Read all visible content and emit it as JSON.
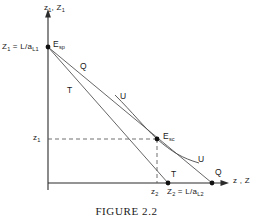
{
  "figure": {
    "caption": "FIGURE 2.2",
    "axes": {
      "y_axis_label_html": "z<sub>1</sub>, Z<sub>1</sub>",
      "y_axis_label_text": "z1, Z1",
      "x_axis_label_html": "z , Z",
      "x_axis_label_text": "z , Z",
      "y_intercept_label_html": "Z<sub>1</sub> = L/a<sub>L1</sub>",
      "y_intercept_label_text": "Z1 = L/aL1",
      "y_tick_label_html": "z<sub>1</sub>",
      "y_tick_label_text": "z1",
      "x_tick_label_html": "z<sub>2</sub>",
      "x_tick_label_text": "z2",
      "x_intercept_label_html": "Z<sub>2</sub> = L/a<sub>L2</sub>",
      "x_intercept_label_text": "Z2 = L/aL2"
    },
    "points": [
      {
        "id": "E-sp",
        "label_html": "E<sub>sp</sub>",
        "label_text": "Esp",
        "x": 48,
        "y": 47
      },
      {
        "id": "E-sc",
        "label_html": "E<sub>sc</sub>",
        "label_text": "Esc",
        "x": 157,
        "y": 139
      },
      {
        "id": "T-endpoint",
        "label_html": "T",
        "label_text": "T",
        "x": 168,
        "y": 183
      },
      {
        "id": "Q-endpoint",
        "label_html": "Q",
        "label_text": "Q",
        "x": 212,
        "y": 183
      }
    ],
    "curve_labels": [
      {
        "id": "Q-upper",
        "text": "Q",
        "x": 80,
        "y": 66
      },
      {
        "id": "T-upper",
        "text": "T",
        "x": 67,
        "y": 90
      },
      {
        "id": "U-upper",
        "text": "U",
        "x": 121,
        "y": 97
      },
      {
        "id": "U-lower",
        "text": "U",
        "x": 197,
        "y": 157
      },
      {
        "id": "T-bottom",
        "text": "T",
        "x": 173,
        "y": 174
      },
      {
        "id": "Q-bottom",
        "text": "Q",
        "x": 217,
        "y": 172
      }
    ],
    "colors": {
      "ink": "#1a1a1a",
      "line": "#3a3a3a",
      "background": "#ffffff"
    }
  }
}
